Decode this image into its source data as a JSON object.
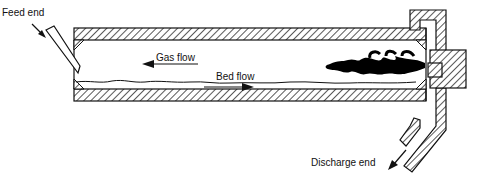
{
  "diagram": {
    "type": "rotary-kiln-cross-section",
    "labels": {
      "feed_end": "Feed end",
      "gas_flow": "Gas flow",
      "bed_flow": "Bed flow",
      "discharge_end": "Discharge end"
    },
    "components": [
      "kiln-shell",
      "refractory-lining",
      "feed-chute",
      "burner-flame",
      "material-bed",
      "firing-hood",
      "seal-ring",
      "discharge-chute"
    ],
    "flow_directions": {
      "gas": "right-to-left",
      "bed": "left-to-right"
    },
    "colors": {
      "stroke": "#111111",
      "flame": "#000000",
      "background": "#ffffff"
    }
  }
}
